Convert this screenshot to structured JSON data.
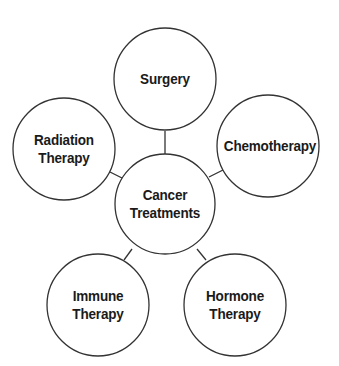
{
  "diagram": {
    "type": "hub-and-spoke",
    "center": {
      "label_line1": "Cancer",
      "label_line2": "Treatments"
    },
    "nodes": [
      {
        "id": "surgery",
        "label_line1": "Surgery",
        "label_line2": ""
      },
      {
        "id": "chemotherapy",
        "label_line1": "Chemotherapy",
        "label_line2": ""
      },
      {
        "id": "hormone",
        "label_line1": "Hormone",
        "label_line2": "Therapy"
      },
      {
        "id": "immune",
        "label_line1": "Immune",
        "label_line2": "Therapy"
      },
      {
        "id": "radiation",
        "label_line1": "Radiation",
        "label_line2": "Therapy"
      }
    ],
    "colors": {
      "stroke": "#333333",
      "text": "#1a1a1a",
      "background": "#ffffff"
    }
  }
}
